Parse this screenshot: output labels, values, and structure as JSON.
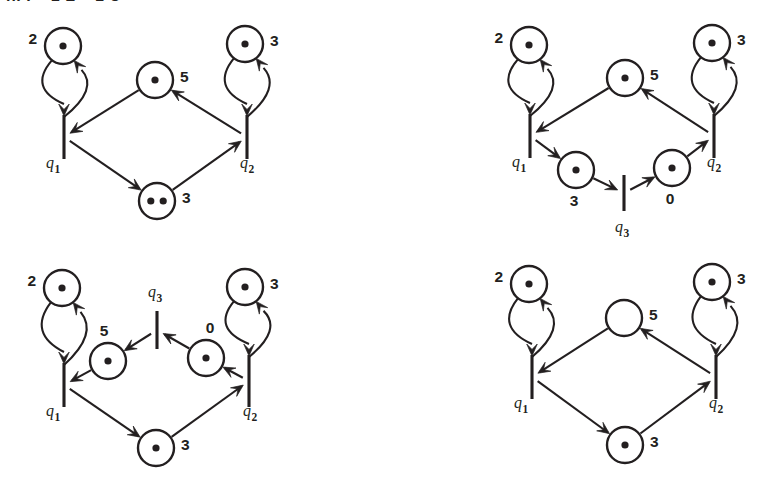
{
  "page": {
    "width": 764,
    "height": 483,
    "background": "#ffffff",
    "ink_color": "#231f20",
    "clipped_heading": "n. I + 1 L + 1 U",
    "figure_type": "petri-net-diagram-grid",
    "panel_count": 4
  },
  "panels": [
    {
      "id": "panel-top-left",
      "position": "top-left",
      "origin": {
        "x": 0,
        "y": 0
      },
      "places": [
        {
          "id": "p-upper-left",
          "label": "2",
          "label_side": "left",
          "tokens": 1,
          "cx": 63,
          "cy": 46,
          "r": 18
        },
        {
          "id": "p-center",
          "label": "5",
          "label_side": "right",
          "tokens": 1,
          "cx": 155,
          "cy": 80,
          "r": 18
        },
        {
          "id": "p-upper-right",
          "label": "3",
          "label_side": "right",
          "tokens": 1,
          "cx": 245,
          "cy": 44,
          "r": 18
        },
        {
          "id": "p-bottom",
          "label": "3",
          "label_side": "right",
          "tokens": 2,
          "cx": 157,
          "cy": 201,
          "r": 18
        }
      ],
      "transitions": [
        {
          "id": "q1",
          "label": "q",
          "subscript": "1",
          "x": 64,
          "y": 137,
          "half_height": 22,
          "label_x": 46,
          "label_y": 168
        },
        {
          "id": "q2",
          "label": "q",
          "subscript": "2",
          "x": 247,
          "y": 137,
          "half_height": 22,
          "label_x": 240,
          "label_y": 168
        }
      ],
      "arcs": [
        {
          "from": "q1",
          "to": "p-upper-left",
          "kind": "self-loop-right"
        },
        {
          "from": "p-upper-left",
          "to": "q1",
          "kind": "self-loop-left"
        },
        {
          "from": "q2",
          "to": "p-upper-right",
          "kind": "self-loop-right"
        },
        {
          "from": "p-upper-right",
          "to": "q2",
          "kind": "self-loop-left"
        },
        {
          "from": "p-center",
          "to": "q1",
          "kind": "straight"
        },
        {
          "from": "q2",
          "to": "p-center",
          "kind": "straight"
        },
        {
          "from": "q1",
          "to": "p-bottom",
          "kind": "straight"
        },
        {
          "from": "p-bottom",
          "to": "q2",
          "kind": "straight"
        }
      ]
    },
    {
      "id": "panel-top-right",
      "position": "top-right",
      "origin": {
        "x": 460,
        "y": 0
      },
      "places": [
        {
          "id": "p-upper-left",
          "label": "2",
          "label_side": "left",
          "tokens": 1,
          "cx": 529,
          "cy": 45,
          "r": 18
        },
        {
          "id": "p-center",
          "label": "5",
          "label_side": "right",
          "tokens": 1,
          "cx": 625,
          "cy": 78,
          "r": 18
        },
        {
          "id": "p-upper-right",
          "label": "3",
          "label_side": "right",
          "tokens": 1,
          "cx": 712,
          "cy": 43,
          "r": 18
        },
        {
          "id": "p-lower-left",
          "label": "3",
          "label_side": "below",
          "tokens": 1,
          "cx": 576,
          "cy": 170,
          "r": 18
        },
        {
          "id": "p-lower-right",
          "label": "0",
          "label_side": "below",
          "tokens": 1,
          "cx": 672,
          "cy": 168,
          "r": 18
        }
      ],
      "transitions": [
        {
          "id": "q1",
          "label": "q",
          "subscript": "1",
          "x": 530,
          "y": 136,
          "half_height": 22,
          "label_x": 512,
          "label_y": 167
        },
        {
          "id": "q2",
          "label": "q",
          "subscript": "2",
          "x": 714,
          "y": 136,
          "half_height": 22,
          "label_x": 707,
          "label_y": 167
        },
        {
          "id": "q3",
          "label": "q",
          "subscript": "3",
          "x": 624,
          "y": 193,
          "half_height": 18,
          "label_x": 615,
          "label_y": 232
        }
      ],
      "arcs": [
        {
          "from": "q1",
          "to": "p-upper-left",
          "kind": "self-loop-right"
        },
        {
          "from": "p-upper-left",
          "to": "q1",
          "kind": "self-loop-left"
        },
        {
          "from": "q2",
          "to": "p-upper-right",
          "kind": "self-loop-right"
        },
        {
          "from": "p-upper-right",
          "to": "q2",
          "kind": "self-loop-left"
        },
        {
          "from": "p-center",
          "to": "q1",
          "kind": "straight"
        },
        {
          "from": "q2",
          "to": "p-center",
          "kind": "straight"
        },
        {
          "from": "q1",
          "to": "p-lower-left",
          "kind": "straight"
        },
        {
          "from": "p-lower-left",
          "to": "q3",
          "kind": "straight"
        },
        {
          "from": "q3",
          "to": "p-lower-right",
          "kind": "straight"
        },
        {
          "from": "p-lower-right",
          "to": "q2",
          "kind": "straight"
        }
      ]
    },
    {
      "id": "panel-bottom-left",
      "position": "bottom-left",
      "origin": {
        "x": 0,
        "y": 255
      },
      "places": [
        {
          "id": "p-upper-left",
          "label": "2",
          "label_side": "left",
          "tokens": 1,
          "cx": 62,
          "cy": 288,
          "r": 18
        },
        {
          "id": "p-center-left",
          "label": "5",
          "label_side": "above-left",
          "tokens": 1,
          "cx": 108,
          "cy": 361,
          "r": 18
        },
        {
          "id": "p-center-right",
          "label": "0",
          "label_side": "above-right",
          "tokens": 1,
          "cx": 206,
          "cy": 358,
          "r": 18
        },
        {
          "id": "p-upper-right",
          "label": "3",
          "label_side": "right",
          "tokens": 1,
          "cx": 245,
          "cy": 287,
          "r": 18
        },
        {
          "id": "p-bottom",
          "label": "3",
          "label_side": "right",
          "tokens": 1,
          "cx": 156,
          "cy": 448,
          "r": 18
        }
      ],
      "transitions": [
        {
          "id": "q1",
          "label": "q",
          "subscript": "1",
          "x": 64,
          "y": 385,
          "half_height": 22,
          "label_x": 46,
          "label_y": 416
        },
        {
          "id": "q2",
          "label": "q",
          "subscript": "2",
          "x": 249,
          "y": 381,
          "half_height": 26,
          "label_x": 243,
          "label_y": 416
        },
        {
          "id": "q3",
          "label": "q",
          "subscript": "3",
          "x": 157,
          "y": 330,
          "half_height": 19,
          "label_x": 148,
          "label_y": 297
        }
      ],
      "arcs": [
        {
          "from": "q1",
          "to": "p-upper-left",
          "kind": "self-loop-right"
        },
        {
          "from": "p-upper-left",
          "to": "q1",
          "kind": "self-loop-left"
        },
        {
          "from": "q2",
          "to": "p-upper-right",
          "kind": "self-loop-right"
        },
        {
          "from": "p-upper-right",
          "to": "q2",
          "kind": "self-loop-left"
        },
        {
          "from": "p-center-left",
          "to": "q1",
          "kind": "straight"
        },
        {
          "from": "q3",
          "to": "p-center-left",
          "kind": "straight"
        },
        {
          "from": "p-center-right",
          "to": "q3",
          "kind": "straight"
        },
        {
          "from": "q2",
          "to": "p-center-right",
          "kind": "straight"
        },
        {
          "from": "q1",
          "to": "p-bottom",
          "kind": "straight"
        },
        {
          "from": "p-bottom",
          "to": "q2",
          "kind": "straight"
        }
      ]
    },
    {
      "id": "panel-bottom-right",
      "position": "bottom-right",
      "origin": {
        "x": 460,
        "y": 255
      },
      "places": [
        {
          "id": "p-upper-left",
          "label": "2",
          "label_side": "left",
          "tokens": 1,
          "cx": 529,
          "cy": 284,
          "r": 18
        },
        {
          "id": "p-center",
          "label": "5",
          "label_side": "right",
          "tokens": 0,
          "cx": 624,
          "cy": 318,
          "r": 18
        },
        {
          "id": "p-upper-right",
          "label": "3",
          "label_side": "right",
          "tokens": 1,
          "cx": 712,
          "cy": 282,
          "r": 18
        },
        {
          "id": "p-bottom",
          "label": "3",
          "label_side": "right",
          "tokens": 1,
          "cx": 625,
          "cy": 445,
          "r": 18
        }
      ],
      "transitions": [
        {
          "id": "q1",
          "label": "q",
          "subscript": "1",
          "x": 532,
          "y": 377,
          "half_height": 22,
          "label_x": 514,
          "label_y": 408
        },
        {
          "id": "q2",
          "label": "q",
          "subscript": "2",
          "x": 716,
          "y": 377,
          "half_height": 22,
          "label_x": 709,
          "label_y": 408
        }
      ],
      "arcs": [
        {
          "from": "q1",
          "to": "p-upper-left",
          "kind": "self-loop-right"
        },
        {
          "from": "p-upper-left",
          "to": "q1",
          "kind": "self-loop-left"
        },
        {
          "from": "q2",
          "to": "p-upper-right",
          "kind": "self-loop-right"
        },
        {
          "from": "p-upper-right",
          "to": "q2",
          "kind": "self-loop-left"
        },
        {
          "from": "p-center",
          "to": "q1",
          "kind": "straight"
        },
        {
          "from": "q2",
          "to": "p-center",
          "kind": "straight"
        },
        {
          "from": "q1",
          "to": "p-bottom",
          "kind": "straight"
        },
        {
          "from": "p-bottom",
          "to": "q2",
          "kind": "straight"
        }
      ]
    }
  ]
}
